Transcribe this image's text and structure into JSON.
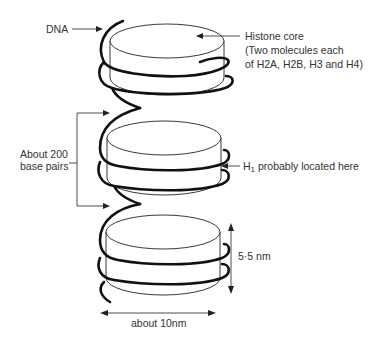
{
  "labels": {
    "dna": "DNA",
    "histone_core": "Histone core",
    "histone_core_detail_1": "(Two molecules each",
    "histone_core_detail_2": "of H2A, H2B, H3 and H4)",
    "linker_line_1": "About 200",
    "linker_line_2": "base pairs",
    "h1": "H",
    "h1_sub": "1",
    "h1_rest": " probably located here",
    "height": "5·5 nm",
    "width": "about 10nm"
  },
  "nucleosomes": [
    {
      "id": "top"
    },
    {
      "id": "middle"
    },
    {
      "id": "bottom"
    }
  ],
  "colors": {
    "line": "#222222",
    "dna": "#111111",
    "text": "#333333",
    "background": "#ffffff"
  }
}
